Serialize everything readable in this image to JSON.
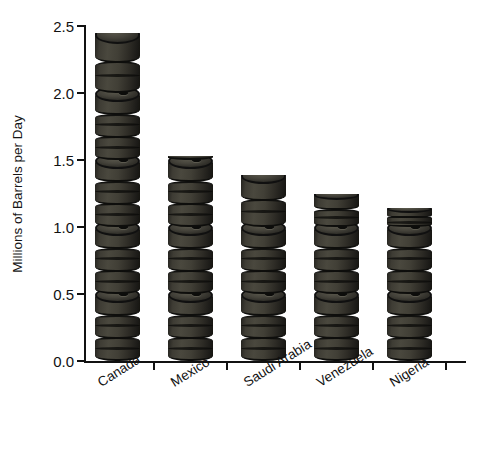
{
  "chart_data": {
    "type": "bar",
    "title": "",
    "subtitle": "",
    "xlabel": "",
    "ylabel": "Millions of Barrels per Day",
    "categories": [
      "Canada",
      "Mexico",
      "Saudi Arabia",
      "Venezuela",
      "Nigeria"
    ],
    "values": [
      2.45,
      1.53,
      1.39,
      1.25,
      1.14
    ],
    "ylim": [
      0.0,
      2.5
    ],
    "ytick_values": [
      0.0,
      0.5,
      1.0,
      1.5,
      2.0,
      2.5
    ],
    "ytick_labels": [
      "0.0",
      "0.5",
      "1.0",
      "1.5",
      "2.0",
      "2.5"
    ],
    "grid": false,
    "legend": false,
    "legend_position": "none",
    "bar_style": "stacked-oil-barrel-pictograph",
    "barrel_unit": 0.5,
    "annotations": []
  },
  "axes": {
    "y_title": "Millions of Barrels per Day",
    "x_title": ""
  },
  "colors": {
    "barrel_body": "#3e3c34",
    "barrel_band": "#121210",
    "barrel_top": "#44423a",
    "axis": "#111111",
    "text": "#111111",
    "background": "#ffffff"
  }
}
